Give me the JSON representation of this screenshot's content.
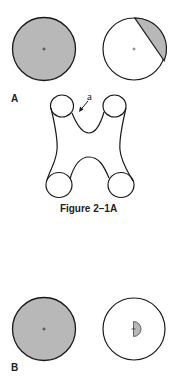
{
  "figure": {
    "caption": "Figure 2–1A",
    "panels": [
      {
        "label": "A",
        "left_circle": {
          "fill": "shaded",
          "description": "fully shaded disc with center mark"
        },
        "right_circle": {
          "fill": "partial",
          "description": "white disc with shaded segment at upper right, center mark"
        }
      },
      {
        "label": "B",
        "left_circle": {
          "fill": "shaded",
          "description": "fully shaded disc with center mark"
        },
        "right_circle": {
          "fill": "partial",
          "description": "white disc with small shaded half-disc at center"
        }
      }
    ],
    "shape": {
      "description": "H-shaped tubular outline with four circular openings",
      "annotation": "a"
    },
    "colors": {
      "stroke": "#1a1a1a",
      "shade": "#b8b8b8",
      "background": "#ffffff"
    }
  }
}
